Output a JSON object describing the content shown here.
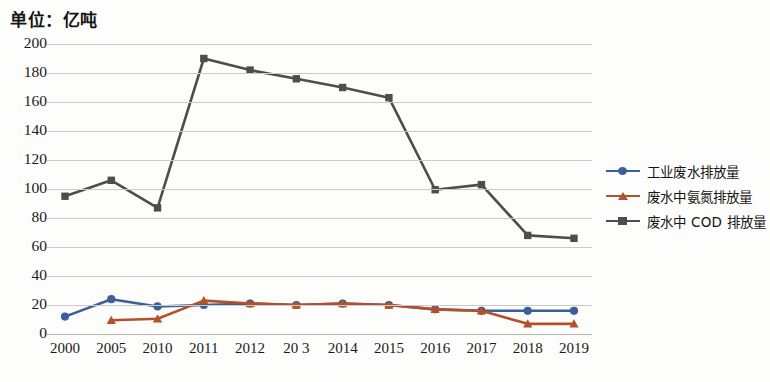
{
  "unit_title": "单位：亿吨",
  "axis": {
    "x_title": "年份",
    "y_ticks": [
      "200",
      "180",
      "160",
      "140",
      "120",
      "100",
      "80",
      "60",
      "40",
      "20",
      "0"
    ],
    "x_ticks": [
      "2000",
      "2005",
      "2010",
      "2011",
      "2012",
      "20 3",
      "2014",
      "2015",
      "2016",
      "2017",
      "2018",
      "2019"
    ]
  },
  "legend": {
    "items": [
      {
        "label": "工业废水排放量",
        "color": "#3b5f99",
        "marker": "circle"
      },
      {
        "label": "废水中氨氮排放量",
        "color": "#b4502a",
        "marker": "triangle"
      },
      {
        "label": "废水中 COD 排放量",
        "color": "#4d4d4d",
        "marker": "square"
      }
    ]
  },
  "chart_data": {
    "type": "line",
    "title": "单位：亿吨",
    "xlabel": "年份",
    "ylabel": "",
    "ylim": [
      0,
      200
    ],
    "grid": true,
    "legend_position": "right",
    "categories": [
      "2000",
      "2005",
      "2010",
      "2011",
      "2012",
      "2013",
      "2014",
      "2015",
      "2016",
      "2017",
      "2018",
      "2019"
    ],
    "series": [
      {
        "name": "工业废水排放量",
        "color": "#3b5f99",
        "marker": "circle",
        "values": [
          12,
          24,
          19,
          20,
          21,
          20,
          21,
          20,
          17,
          16,
          16,
          16
        ]
      },
      {
        "name": "废水中氨氮排放量",
        "color": "#b4502a",
        "marker": "triangle",
        "values": [
          null,
          9.5,
          10.5,
          23,
          21,
          20,
          21,
          20,
          17,
          16,
          7,
          7
        ]
      },
      {
        "name": "废水中COD排放量",
        "color": "#4d4d4d",
        "marker": "square",
        "values": [
          95,
          106,
          87,
          190,
          182,
          176,
          170,
          163,
          99.5,
          103,
          68,
          66
        ]
      }
    ]
  }
}
